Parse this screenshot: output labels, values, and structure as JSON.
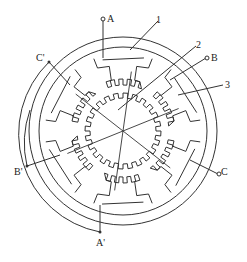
{
  "diagram": {
    "title": "",
    "type": "three-phase variable reluctance stepper motor cross-section",
    "phase_labels": {
      "A": "A",
      "A_prime": "A'",
      "B": "B",
      "B_prime": "B'",
      "C": "C",
      "C_prime": "C'"
    },
    "part_labels": {
      "stator": "1",
      "rotor": "2",
      "winding": "3"
    },
    "colors": {
      "line": "#333333",
      "background": "#ffffff"
    }
  }
}
